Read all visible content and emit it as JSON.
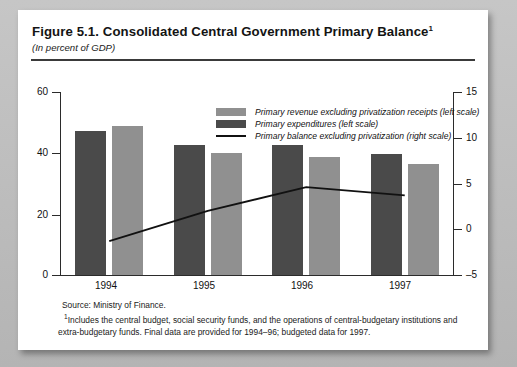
{
  "figure": {
    "title": "Figure 5.1. Consolidated Central Government Primary Balance",
    "title_superscript": "1",
    "subtitle": "(In percent of GDP)"
  },
  "legend": {
    "revenue_label": "Primary revenue excluding privatization receipts (left scale)",
    "expenditure_label": "Primary expenditures (left scale)",
    "balance_label": "Primary balance excluding privatization (right scale)"
  },
  "notes": {
    "source": "Source: Ministry of Finance.",
    "footnote_marker": "1",
    "footnote": "Includes the central budget, social security funds, and the operations of central-budgetary institutions and extra-budgetary funds. Final data are provided for 1994–96; budgeted data for 1997."
  },
  "colors": {
    "revenue": "#909090",
    "expenditure": "#4a4a4a",
    "balance_line": "#111111",
    "axis": "#2b2b2b",
    "card": "#ffffff",
    "backdrop": "#b9b9b9"
  },
  "chart_data": {
    "type": "bar",
    "title": "Figure 5.1. Consolidated Central Government Primary Balance",
    "subtitle": "(In percent of GDP)",
    "xlabel": "",
    "ylabel": "",
    "categories": [
      "1994",
      "1995",
      "1996",
      "1997"
    ],
    "grid": false,
    "legend_position": "top-center",
    "left_axis": {
      "label": "In percent of GDP (left scale)",
      "ticks": [
        0,
        20,
        40,
        60
      ],
      "ylim": [
        0,
        60
      ]
    },
    "right_axis": {
      "label": "In percent of GDP (right scale)",
      "ticks": [
        -5,
        0,
        5,
        10,
        15
      ],
      "ylim": [
        -5,
        15
      ]
    },
    "series": [
      {
        "name": "Primary expenditures (left scale)",
        "type": "bar",
        "axis": "left",
        "color": "#4a4a4a",
        "values": [
          47.3,
          42.5,
          42.5,
          39.6
        ]
      },
      {
        "name": "Primary revenue excluding privatization receipts (left scale)",
        "type": "bar",
        "axis": "left",
        "color": "#909090",
        "values": [
          48.7,
          40.1,
          38.6,
          36.3
        ]
      },
      {
        "name": "Primary balance excluding privatization (right scale)",
        "type": "line",
        "axis": "right",
        "color": "#111111",
        "values": [
          -1.3,
          2.0,
          4.6,
          3.7
        ]
      }
    ]
  },
  "axis_labels": {
    "left": [
      "60",
      "40",
      "20",
      "0"
    ],
    "right": [
      "15",
      "10",
      "5",
      "0",
      "–5"
    ],
    "x": [
      "1994",
      "1995",
      "1996",
      "1997"
    ]
  }
}
